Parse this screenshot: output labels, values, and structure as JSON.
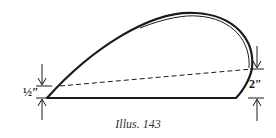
{
  "figure": {
    "caption": "Illus. 143",
    "left_dimension": {
      "label": "½″",
      "value_inches": 0.5
    },
    "right_dimension": {
      "label": "2″",
      "value_inches": 2
    },
    "colors": {
      "ink": "#1a1a1a",
      "background": "#ffffff"
    }
  }
}
